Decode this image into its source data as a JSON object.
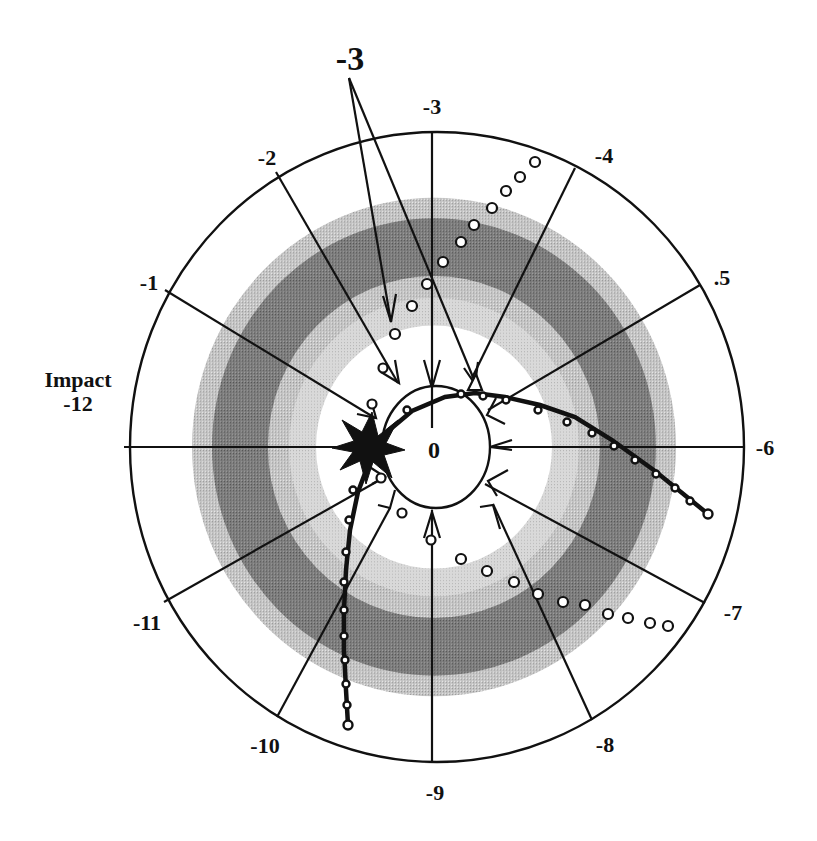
{
  "figure": {
    "title_callout": "-3",
    "center_label": "0",
    "impact_label": "Impact",
    "impact_value": "-12",
    "colors": {
      "light_band": "#bdbdbd",
      "dark_band": "#7a7a7a",
      "inner_light_band": "#d6d6d6",
      "line": "#111111",
      "background": "#ffffff"
    },
    "spoke_labels": [
      {
        "id": "spoke-3",
        "text": "-3"
      },
      {
        "id": "spoke-4",
        "text": "-4"
      },
      {
        "id": "spoke-5",
        "text": ".5"
      },
      {
        "id": "spoke-6",
        "text": "-6"
      },
      {
        "id": "spoke-7",
        "text": "-7"
      },
      {
        "id": "spoke-8",
        "text": "-8"
      },
      {
        "id": "spoke-9",
        "text": "-9"
      },
      {
        "id": "spoke-10",
        "text": "-10"
      },
      {
        "id": "spoke-11",
        "text": "-11"
      },
      {
        "id": "spoke-1",
        "text": "-1"
      },
      {
        "id": "spoke-2",
        "text": "-2"
      }
    ]
  }
}
